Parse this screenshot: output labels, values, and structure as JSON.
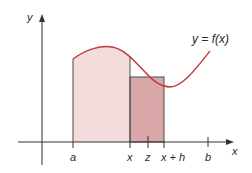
{
  "diagram": {
    "curve_label": "y = f(x)",
    "axis_labels": {
      "y": "y",
      "x": "x"
    },
    "tick_labels": {
      "a": "a",
      "x": "x",
      "z": "z",
      "x_plus_h": "x + h",
      "b": "b"
    },
    "colors": {
      "curve": "#c0393b",
      "area_fill": "#f3dcdc",
      "rect_fill": "#d9a7a8",
      "axis": "#333333",
      "edge": "#4a4a4a"
    }
  }
}
